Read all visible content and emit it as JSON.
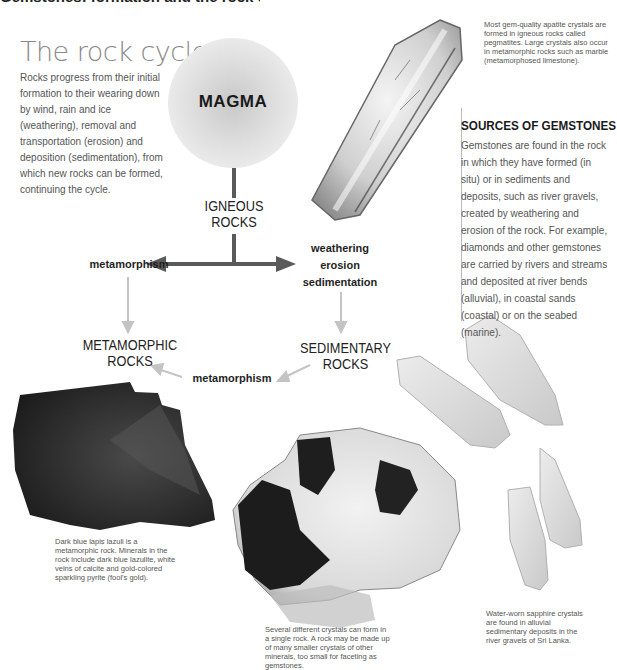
{
  "page": {
    "clipped_heading": "Gemstones: formation and the rock cycle"
  },
  "rock_cycle": {
    "title": "The rock cycle",
    "intro": "Rocks progress from their initial formation to their wearing down by wind, rain and ice (weathering), removal and transportation (erosion) and deposition (sedimentation), from which new rocks can be formed, continuing the cycle."
  },
  "diagram": {
    "magma": "MAGMA",
    "igneous": [
      "IGNEOUS",
      "ROCKS"
    ],
    "metamorphic": [
      "METAMORPHIC",
      "ROCKS"
    ],
    "sedimentary": [
      "SEDIMENTARY",
      "ROCKS"
    ],
    "process_metamorphism_top": "metamorphism",
    "process_weathering": [
      "weathering",
      "erosion",
      "sedimentation"
    ],
    "process_metamorphism_bottom": "metamorphism",
    "colors": {
      "main_arrow": "#5a5a5a",
      "light_arrow": "#c4c4c4"
    }
  },
  "captions": {
    "apatite": "Most gem-quality apatite crystals are formed in igneous rocks called pegmatites. Large crystals also occur in metamorphic rocks such as marble (metamorphosed limestone).",
    "lapis": "Dark blue lapis lazuli is a metamorphic rock. Minerals in the rock include dark blue lazulite, white veins of calcite and gold-colored sparkling pyrite (fool's gold).",
    "crystals": "Several different crystals can form in a single rock. A rock may be made up of many smaller crystals of other minerals, too small for faceting as gemstones.",
    "sapphire": "Water-worn sapphire crystals are found in alluvial sedimentary deposits in the river gravels of Sri Lanka."
  },
  "sources": {
    "heading": "SOURCES OF GEMSTONES",
    "body": "Gemstones are found in the rock in which they have formed (in situ) or in sediments and deposits, such as river gravels, created by weathering and erosion of the rock. For example, diamonds and other gemstones are carried by rivers and streams and deposited at river bends (alluvial), in coastal sands (coastal) or on the seabed (marine)."
  }
}
